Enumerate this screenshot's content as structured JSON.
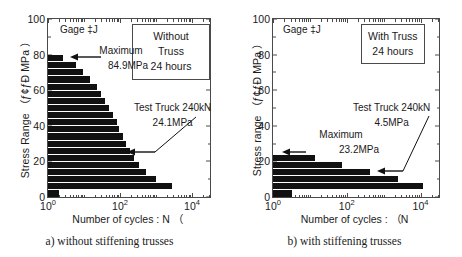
{
  "figure": {
    "panels": [
      {
        "id": "without-truss",
        "gage_label": "Gage ‡J",
        "legend_line1": "Without Truss",
        "legend_line2": "24 hours",
        "max_label": "Maximum",
        "max_value": "84.9MPa",
        "truck_line1": "Test Truck 240kN",
        "truck_line2": "24.1MPa",
        "caption": "a) without stiffening trusses",
        "chart_data": {
          "type": "bar",
          "orientation": "horizontal",
          "title": "",
          "xlabel": "Number of cycles : N （",
          "ylabel": "Stress Range （ƒ¢ƒÐ MPa ）",
          "xscale": "log",
          "xlim": [
            1,
            31623
          ],
          "xticks": [
            "10⁰",
            "10²",
            "10⁴"
          ],
          "xtickvalues": [
            1,
            100,
            10000
          ],
          "ylim": [
            0,
            100
          ],
          "yticks": [
            0,
            20,
            40,
            60,
            80,
            100
          ],
          "grid": false,
          "legend": "Without Truss / 24 hours",
          "categories": [
            2,
            6,
            10,
            14,
            18,
            22,
            26,
            30,
            34,
            38,
            42,
            46,
            50,
            54,
            58,
            62,
            66,
            70,
            74,
            78
          ],
          "values": [
            2.0,
            2700.0,
            1000.0,
            520.0,
            330.0,
            250.0,
            190.0,
            150.0,
            120.0,
            95.0,
            80.0,
            62.0,
            50.0,
            38.0,
            30.0,
            23.0,
            15.0,
            9.5,
            6.0,
            2.6
          ]
        }
      },
      {
        "id": "with-truss",
        "gage_label": "Gage ‡J",
        "legend_line1": "With Truss",
        "legend_line2": "24 hours",
        "max_label": "Maximum",
        "max_value": "23.2MPa",
        "truck_line1": "Test Truck 240kN",
        "truck_line2": "4.5MPa",
        "caption": "b) with stiffening trusses",
        "chart_data": {
          "type": "bar",
          "orientation": "horizontal",
          "title": "",
          "xlabel": "Number of cycles : （N",
          "ylabel": "Stress range （ƒ¢ƒÐ MPa ）",
          "xscale": "log",
          "xlim": [
            1,
            31623
          ],
          "xticks": [
            "10⁰",
            "10²",
            "10⁴"
          ],
          "xtickvalues": [
            1,
            100,
            10000
          ],
          "ylim": [
            0,
            100
          ],
          "yticks": [
            0,
            20,
            40,
            60,
            80,
            100
          ],
          "grid": false,
          "legend": "With Truss / 24 hours",
          "categories": [
            2,
            6,
            10,
            14,
            18,
            22
          ],
          "values": [
            3.2,
            12000.0,
            2400.0,
            420.0,
            75.0,
            14.0
          ],
          "extra_bars": [
            {
              "y": 18,
              "value": 40.0
            },
            {
              "y": 14,
              "value": 420.0
            }
          ]
        }
      }
    ]
  }
}
